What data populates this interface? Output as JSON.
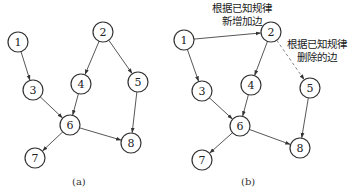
{
  "panels": [
    {
      "id": "a",
      "caption": "(a)",
      "nodes": [
        {
          "id": "1",
          "label": "1",
          "x": 18,
          "y": 42
        },
        {
          "id": "2",
          "label": "2",
          "x": 103,
          "y": 32
        },
        {
          "id": "3",
          "label": "3",
          "x": 33,
          "y": 90
        },
        {
          "id": "4",
          "label": "4",
          "x": 81,
          "y": 84
        },
        {
          "id": "5",
          "label": "5",
          "x": 138,
          "y": 82
        },
        {
          "id": "6",
          "label": "6",
          "x": 70,
          "y": 125
        },
        {
          "id": "7",
          "label": "7",
          "x": 35,
          "y": 158
        },
        {
          "id": "8",
          "label": "8",
          "x": 131,
          "y": 143
        }
      ],
      "edges": [
        {
          "from": "1",
          "to": "3",
          "style": "solid"
        },
        {
          "from": "2",
          "to": "4",
          "style": "solid"
        },
        {
          "from": "2",
          "to": "5",
          "style": "solid"
        },
        {
          "from": "3",
          "to": "6",
          "style": "solid"
        },
        {
          "from": "4",
          "to": "6",
          "style": "solid"
        },
        {
          "from": "5",
          "to": "8",
          "style": "solid"
        },
        {
          "from": "6",
          "to": "7",
          "style": "solid"
        },
        {
          "from": "6",
          "to": "8",
          "style": "solid"
        }
      ]
    },
    {
      "id": "b",
      "caption": "(b)",
      "nodes": [
        {
          "id": "1",
          "label": "1",
          "x": 184,
          "y": 40
        },
        {
          "id": "2",
          "label": "2",
          "x": 271,
          "y": 32
        },
        {
          "id": "3",
          "label": "3",
          "x": 202,
          "y": 91
        },
        {
          "id": "4",
          "label": "4",
          "x": 251,
          "y": 85
        },
        {
          "id": "5",
          "label": "5",
          "x": 310,
          "y": 88
        },
        {
          "id": "6",
          "label": "6",
          "x": 240,
          "y": 126
        },
        {
          "id": "7",
          "label": "7",
          "x": 202,
          "y": 160
        },
        {
          "id": "8",
          "label": "8",
          "x": 300,
          "y": 148
        }
      ],
      "edges": [
        {
          "from": "1",
          "to": "2",
          "style": "solid"
        },
        {
          "from": "1",
          "to": "3",
          "style": "solid"
        },
        {
          "from": "2",
          "to": "4",
          "style": "solid"
        },
        {
          "from": "2",
          "to": "5",
          "style": "dashed"
        },
        {
          "from": "3",
          "to": "6",
          "style": "solid"
        },
        {
          "from": "4",
          "to": "6",
          "style": "solid"
        },
        {
          "from": "5",
          "to": "8",
          "style": "solid"
        },
        {
          "from": "6",
          "to": "7",
          "style": "solid"
        },
        {
          "from": "6",
          "to": "8",
          "style": "solid"
        }
      ],
      "annotations": {
        "added_edge": {
          "line1": "根据已知规律",
          "line2": "新增加边"
        },
        "removed_edge": {
          "line1": "根据已知规律",
          "line2": "删除的边"
        }
      }
    }
  ],
  "node_radius": 10
}
